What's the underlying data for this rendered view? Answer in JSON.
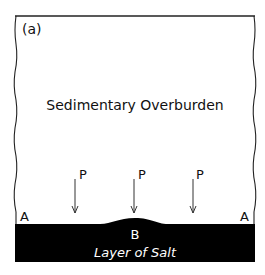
{
  "figure": {
    "panel_label": "(a)",
    "overburden_label": "Sedimentary Overburden",
    "salt_label": "Layer of Salt",
    "point_a_left": "A",
    "point_a_right": "A",
    "point_b": "B",
    "pressure_labels": [
      "P",
      "P",
      "P"
    ]
  },
  "colors": {
    "salt": "#000000",
    "background": "#ffffff",
    "line": "#222222"
  }
}
